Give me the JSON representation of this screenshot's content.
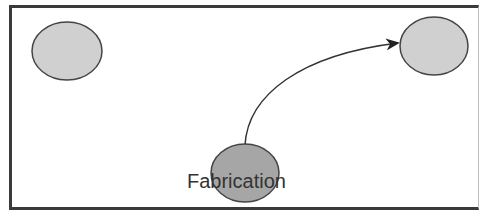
{
  "diagram": {
    "nodes": [
      {
        "id": "node-top-left",
        "label": "",
        "cx": 67,
        "cy": 51,
        "rx": 35,
        "ry": 29,
        "fill": "#d0d0d0"
      },
      {
        "id": "node-top-right",
        "label": "",
        "cx": 434,
        "cy": 46,
        "rx": 34,
        "ry": 29,
        "fill": "#d0d0d0"
      },
      {
        "id": "node-fabrication",
        "label": "Fabrication",
        "cx": 245,
        "cy": 173,
        "rx": 34,
        "ry": 29,
        "fill": "#a6a6a6"
      }
    ],
    "edges": [
      {
        "from": "node-fabrication",
        "to": "node-top-right",
        "style": "curved-arrow"
      }
    ],
    "colors": {
      "frame": "#3a3a3a",
      "node_stroke": "#444444",
      "edge": "#333333"
    }
  }
}
